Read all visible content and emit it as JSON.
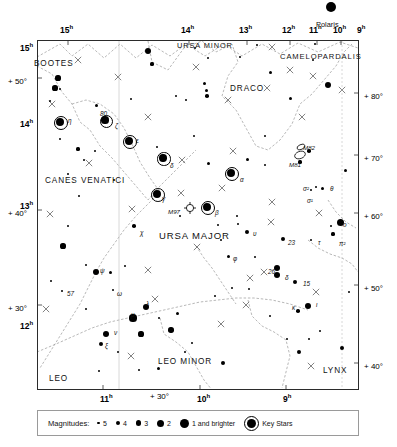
{
  "chart_data": {
    "type": "scatter",
    "projection": "equatorial",
    "xlabel": "Right Ascension (hours)",
    "ylabel": "Declination (degrees)",
    "xlim": [
      15.5,
      8.5
    ],
    "ylim": [
      35,
      85
    ],
    "grid": true,
    "legend_position": "bottom",
    "ra_ticks_top": [
      "15",
      "14",
      "13",
      "12",
      "11",
      "10",
      "9"
    ],
    "ra_ticks_bottom": [
      "11",
      "10",
      "9"
    ],
    "dec_ticks_left": [
      "+50",
      "+40",
      "+30"
    ],
    "dec_ticks_right": [
      "+80",
      "+70",
      "+60",
      "+50",
      "+40"
    ],
    "left_ra_ticks": [
      "15",
      "14",
      "13",
      "12"
    ],
    "constellations": [
      "URSA MAJOR",
      "URSA MINOR",
      "DRACO",
      "CAMELOPARDALIS",
      "BOOTES",
      "CANES VENATICI",
      "LEO",
      "LEO MINOR",
      "LYNX"
    ],
    "named_stars": [
      "Polaris",
      "η",
      "ζ",
      "ε",
      "δ",
      "γ",
      "β",
      "α",
      "χ",
      "ψ",
      "ν",
      "ξ",
      "λ",
      "μ",
      "κ",
      "ι",
      "υ",
      "φ",
      "θ",
      "τ",
      "ο",
      "ω",
      "σ¹",
      "σ²",
      "π²",
      "80",
      "57",
      "26",
      "15",
      "23"
    ],
    "deep_sky": [
      "M81",
      "M82",
      "M97"
    ]
  },
  "frame": {
    "hour_labels_top": [
      {
        "text": "15",
        "sup": "h",
        "x": 60,
        "y": 24
      },
      {
        "text": "14",
        "sup": "h",
        "x": 181,
        "y": 24
      },
      {
        "text": "13",
        "sup": "h",
        "x": 239,
        "y": 24
      },
      {
        "text": "12",
        "sup": "h",
        "x": 282,
        "y": 24
      },
      {
        "text": "11",
        "sup": "h",
        "x": 309,
        "y": 24
      },
      {
        "text": "10",
        "sup": "h",
        "x": 333,
        "y": 24
      },
      {
        "text": "9",
        "sup": "h",
        "x": 357,
        "y": 24
      }
    ],
    "hour_labels_bottom": [
      {
        "text": "11",
        "sup": "h",
        "x": 100,
        "y": 393
      },
      {
        "text": "10",
        "sup": "h",
        "x": 197,
        "y": 393
      },
      {
        "text": "9",
        "sup": "h",
        "x": 283,
        "y": 393
      }
    ],
    "hour_labels_left": [
      {
        "text": "15",
        "sup": "h",
        "x": 20,
        "y": 42
      },
      {
        "text": "14",
        "sup": "h",
        "x": 20,
        "y": 118
      },
      {
        "text": "13",
        "sup": "h",
        "x": 20,
        "y": 200
      },
      {
        "text": "12",
        "sup": "h",
        "x": 20,
        "y": 320
      }
    ],
    "dec_labels_left": [
      {
        "text": "+ 50°",
        "x": 8,
        "y": 78
      },
      {
        "text": "+ 40°",
        "x": 8,
        "y": 210
      },
      {
        "text": "+ 30°",
        "x": 8,
        "y": 305
      }
    ],
    "dec_labels_right": [
      {
        "text": "+ 80°",
        "x": 364,
        "y": 93
      },
      {
        "text": "+ 70°",
        "x": 364,
        "y": 155
      },
      {
        "text": "+ 60°",
        "x": 364,
        "y": 213
      },
      {
        "text": "+ 50°",
        "x": 364,
        "y": 285
      },
      {
        "text": "+ 40°",
        "x": 364,
        "y": 363
      }
    ],
    "bottom_dec_label": {
      "text": "+ 30°",
      "x": 150,
      "y": 393
    }
  },
  "constellation_labels": [
    {
      "name": "BOOTES",
      "x": 34,
      "y": 60,
      "size": 8.2
    },
    {
      "name": "CANES VENATICI",
      "x": 45,
      "y": 177,
      "size": 8.2
    },
    {
      "name": "URSA MAJOR",
      "x": 159,
      "y": 231,
      "size": 9.5
    },
    {
      "name": "URSA MINOR",
      "x": 177,
      "y": 42,
      "size": 7.4
    },
    {
      "name": "DRACO",
      "x": 230,
      "y": 85,
      "size": 8.2
    },
    {
      "name": "CAMELOPARDALIS",
      "x": 280,
      "y": 53,
      "size": 7.6
    },
    {
      "name": "LEO",
      "x": 49,
      "y": 375,
      "size": 8.2
    },
    {
      "name": "LEO MINOR",
      "x": 158,
      "y": 358,
      "size": 8.2
    },
    {
      "name": "LYNX",
      "x": 323,
      "y": 367,
      "size": 8.2
    }
  ],
  "polaris": {
    "label": "Polaris",
    "x": 331,
    "y": 7,
    "label_x": 316,
    "label_y": 21,
    "r": 5.2
  },
  "star_labels": [
    {
      "text": "η",
      "x": 68,
      "y": 118
    },
    {
      "text": "80",
      "x": 100,
      "y": 111
    },
    {
      "text": "ζ",
      "x": 115,
      "y": 123
    },
    {
      "text": "ε",
      "x": 136,
      "y": 138
    },
    {
      "text": "δ",
      "x": 170,
      "y": 163
    },
    {
      "text": "γ",
      "x": 162,
      "y": 196
    },
    {
      "text": "M97",
      "x": 168,
      "y": 209
    },
    {
      "text": "β",
      "x": 215,
      "y": 210
    },
    {
      "text": "α",
      "x": 240,
      "y": 177
    },
    {
      "text": "χ",
      "x": 140,
      "y": 230
    },
    {
      "text": "ψ",
      "x": 100,
      "y": 268
    },
    {
      "text": "57",
      "x": 67,
      "y": 291
    },
    {
      "text": "ω",
      "x": 117,
      "y": 291
    },
    {
      "text": "ν",
      "x": 114,
      "y": 330
    },
    {
      "text": "ξ",
      "x": 105,
      "y": 343
    },
    {
      "text": "λ",
      "x": 146,
      "y": 301
    },
    {
      "text": "μ",
      "x": 131,
      "y": 312
    },
    {
      "text": "κ",
      "x": 292,
      "y": 305
    },
    {
      "text": "ι",
      "x": 316,
      "y": 302
    },
    {
      "text": "26",
      "x": 268,
      "y": 269
    },
    {
      "text": "δ",
      "x": 285,
      "y": 275
    },
    {
      "text": "15",
      "x": 303,
      "y": 281
    },
    {
      "text": "φ",
      "x": 233,
      "y": 256
    },
    {
      "text": "υ",
      "x": 253,
      "y": 231
    },
    {
      "text": "23",
      "x": 288,
      "y": 240
    },
    {
      "text": "τ",
      "x": 318,
      "y": 240
    },
    {
      "text": "σ²",
      "x": 303,
      "y": 186
    },
    {
      "text": "σ¹",
      "x": 307,
      "y": 198
    },
    {
      "text": "θ",
      "x": 330,
      "y": 186
    },
    {
      "text": "π²",
      "x": 339,
      "y": 241
    },
    {
      "text": "ο",
      "x": 343,
      "y": 222
    },
    {
      "text": "M81",
      "x": 289,
      "y": 162
    },
    {
      "text": "M82",
      "x": 303,
      "y": 145
    }
  ],
  "legend": {
    "title": "Magnitudes:",
    "items": [
      {
        "label": "5",
        "r": 1.3
      },
      {
        "label": "4",
        "r": 2.0
      },
      {
        "label": "3",
        "r": 2.7
      },
      {
        "label": "2",
        "r": 3.5
      },
      {
        "label": "1 and brighter",
        "r": 4.5
      }
    ],
    "key_stars_label": "Key Stars"
  },
  "stars": [
    {
      "x": 148,
      "y": 51,
      "r": 3.0,
      "key": false
    },
    {
      "x": 195,
      "y": 48,
      "r": 1.3,
      "key": false
    },
    {
      "x": 152,
      "y": 64,
      "r": 1.6,
      "key": false
    },
    {
      "x": 240,
      "y": 57,
      "r": 1.3,
      "key": false
    },
    {
      "x": 257,
      "y": 45,
      "r": 1.4,
      "key": false
    },
    {
      "x": 270,
      "y": 72,
      "r": 1.5,
      "key": false
    },
    {
      "x": 315,
      "y": 44,
      "r": 1.3,
      "key": false
    },
    {
      "x": 313,
      "y": 60,
      "r": 1.4,
      "key": false
    },
    {
      "x": 328,
      "y": 85,
      "r": 3.2,
      "key": false
    },
    {
      "x": 206,
      "y": 90,
      "r": 1.5,
      "key": false
    },
    {
      "x": 207,
      "y": 96,
      "r": 1.8,
      "key": false
    },
    {
      "x": 204,
      "y": 83,
      "r": 1.5,
      "key": false
    },
    {
      "x": 176,
      "y": 96,
      "r": 1.3,
      "key": false
    },
    {
      "x": 186,
      "y": 100,
      "r": 1.3,
      "key": false
    },
    {
      "x": 131,
      "y": 99,
      "r": 1.4,
      "key": false
    },
    {
      "x": 290,
      "y": 98,
      "r": 1.5,
      "key": false
    },
    {
      "x": 58,
      "y": 78,
      "r": 2.6,
      "key": false
    },
    {
      "x": 55,
      "y": 88,
      "r": 2.6,
      "key": false
    },
    {
      "x": 60,
      "y": 89,
      "r": 1.4,
      "key": false
    },
    {
      "x": 50,
      "y": 101,
      "r": 1.4,
      "key": false
    },
    {
      "x": 96,
      "y": 105,
      "r": 1.5,
      "key": false
    },
    {
      "x": 60,
      "y": 122,
      "r": 4.1,
      "key": true
    },
    {
      "x": 105,
      "y": 120,
      "r": 3.6,
      "key": true
    },
    {
      "x": 129,
      "y": 141,
      "r": 4.2,
      "key": true
    },
    {
      "x": 163,
      "y": 158,
      "r": 3.7,
      "key": true
    },
    {
      "x": 157,
      "y": 194,
      "r": 4.0,
      "key": true
    },
    {
      "x": 207,
      "y": 207,
      "r": 4.2,
      "key": true
    },
    {
      "x": 231,
      "y": 173,
      "r": 4.3,
      "key": true
    },
    {
      "x": 60,
      "y": 139,
      "r": 1.4,
      "key": false
    },
    {
      "x": 78,
      "y": 149,
      "r": 1.6,
      "key": false
    },
    {
      "x": 157,
      "y": 147,
      "r": 1.4,
      "key": false
    },
    {
      "x": 194,
      "y": 136,
      "r": 1.4,
      "key": false
    },
    {
      "x": 208,
      "y": 163,
      "r": 1.5,
      "key": false
    },
    {
      "x": 265,
      "y": 136,
      "r": 1.4,
      "key": false
    },
    {
      "x": 247,
      "y": 159,
      "r": 1.5,
      "key": false
    },
    {
      "x": 265,
      "y": 165,
      "r": 1.4,
      "key": false
    },
    {
      "x": 300,
      "y": 162,
      "r": 1.6,
      "key": false
    },
    {
      "x": 309,
      "y": 151,
      "r": 1.8,
      "key": false
    },
    {
      "x": 322,
      "y": 188,
      "r": 1.5,
      "key": false
    },
    {
      "x": 316,
      "y": 187,
      "r": 1.4,
      "key": false
    },
    {
      "x": 311,
      "y": 190,
      "r": 1.3,
      "key": false
    },
    {
      "x": 345,
      "y": 170,
      "r": 1.5,
      "key": false
    },
    {
      "x": 333,
      "y": 234,
      "r": 1.6,
      "key": false
    },
    {
      "x": 331,
      "y": 226,
      "r": 1.3,
      "key": false
    },
    {
      "x": 340,
      "y": 222,
      "r": 3.5,
      "key": false
    },
    {
      "x": 311,
      "y": 240,
      "r": 1.4,
      "key": false
    },
    {
      "x": 283,
      "y": 239,
      "r": 2.1,
      "key": false
    },
    {
      "x": 247,
      "y": 232,
      "r": 2.0,
      "key": false
    },
    {
      "x": 228,
      "y": 256,
      "r": 1.5,
      "key": false
    },
    {
      "x": 79,
      "y": 196,
      "r": 1.4,
      "key": false
    },
    {
      "x": 114,
      "y": 180,
      "r": 1.4,
      "key": false
    },
    {
      "x": 68,
      "y": 174,
      "r": 1.3,
      "key": false
    },
    {
      "x": 95,
      "y": 151,
      "r": 1.4,
      "key": false
    },
    {
      "x": 134,
      "y": 226,
      "r": 1.8,
      "key": false
    },
    {
      "x": 180,
      "y": 216,
      "r": 1.4,
      "key": false
    },
    {
      "x": 218,
      "y": 225,
      "r": 1.4,
      "key": false
    },
    {
      "x": 221,
      "y": 240,
      "r": 1.4,
      "key": false
    },
    {
      "x": 237,
      "y": 216,
      "r": 1.3,
      "key": false
    },
    {
      "x": 238,
      "y": 224,
      "r": 1.3,
      "key": false
    },
    {
      "x": 68,
      "y": 226,
      "r": 1.4,
      "key": false
    },
    {
      "x": 63,
      "y": 246,
      "r": 2.6,
      "key": false
    },
    {
      "x": 51,
      "y": 281,
      "r": 1.3,
      "key": false
    },
    {
      "x": 86,
      "y": 265,
      "r": 1.4,
      "key": false
    },
    {
      "x": 96,
      "y": 272,
      "r": 3.1,
      "key": false
    },
    {
      "x": 110,
      "y": 272,
      "r": 1.5,
      "key": false
    },
    {
      "x": 125,
      "y": 266,
      "r": 1.4,
      "key": false
    },
    {
      "x": 62,
      "y": 291,
      "r": 1.4,
      "key": false
    },
    {
      "x": 113,
      "y": 290,
      "r": 1.3,
      "key": false
    },
    {
      "x": 86,
      "y": 309,
      "r": 1.4,
      "key": false
    },
    {
      "x": 146,
      "y": 307,
      "r": 3.3,
      "key": false
    },
    {
      "x": 133,
      "y": 318,
      "r": 3.6,
      "key": false
    },
    {
      "x": 106,
      "y": 334,
      "r": 3.3,
      "key": false
    },
    {
      "x": 101,
      "y": 344,
      "r": 2.1,
      "key": false
    },
    {
      "x": 141,
      "y": 334,
      "r": 2.6,
      "key": false
    },
    {
      "x": 171,
      "y": 330,
      "r": 2.7,
      "key": false
    },
    {
      "x": 159,
      "y": 318,
      "r": 1.4,
      "key": false
    },
    {
      "x": 177,
      "y": 313,
      "r": 1.5,
      "key": false
    },
    {
      "x": 118,
      "y": 352,
      "r": 1.4,
      "key": false
    },
    {
      "x": 139,
      "y": 370,
      "r": 1.4,
      "key": false
    },
    {
      "x": 158,
      "y": 368,
      "r": 1.5,
      "key": false
    },
    {
      "x": 185,
      "y": 352,
      "r": 1.4,
      "key": false
    },
    {
      "x": 192,
      "y": 343,
      "r": 1.3,
      "key": false
    },
    {
      "x": 223,
      "y": 363,
      "r": 2.1,
      "key": false
    },
    {
      "x": 277,
      "y": 268,
      "r": 3.0,
      "key": false
    },
    {
      "x": 277,
      "y": 275,
      "r": 3.2,
      "key": false
    },
    {
      "x": 295,
      "y": 282,
      "r": 2.4,
      "key": false
    },
    {
      "x": 308,
      "y": 306,
      "r": 3.4,
      "key": false
    },
    {
      "x": 298,
      "y": 311,
      "r": 1.8,
      "key": false
    },
    {
      "x": 255,
      "y": 257,
      "r": 1.3,
      "key": false
    },
    {
      "x": 249,
      "y": 289,
      "r": 1.4,
      "key": false
    },
    {
      "x": 270,
      "y": 316,
      "r": 1.4,
      "key": false
    },
    {
      "x": 320,
      "y": 331,
      "r": 1.4,
      "key": false
    },
    {
      "x": 309,
      "y": 339,
      "r": 1.4,
      "key": false
    },
    {
      "x": 287,
      "y": 339,
      "r": 1.4,
      "key": false
    },
    {
      "x": 299,
      "y": 352,
      "r": 2.3,
      "key": false
    },
    {
      "x": 342,
      "y": 348,
      "r": 2.2,
      "key": false
    },
    {
      "x": 349,
      "y": 292,
      "r": 1.3,
      "key": false
    },
    {
      "x": 232,
      "y": 288,
      "r": 1.3,
      "key": false
    },
    {
      "x": 215,
      "y": 296,
      "r": 1.4,
      "key": false
    },
    {
      "x": 208,
      "y": 58,
      "r": 1.3,
      "key": false
    },
    {
      "x": 99,
      "y": 371,
      "r": 1.3,
      "key": false
    },
    {
      "x": 84,
      "y": 160,
      "r": 1.2,
      "key": false
    }
  ],
  "crosses": [
    {
      "x": 78,
      "y": 60
    },
    {
      "x": 118,
      "y": 77
    },
    {
      "x": 52,
      "y": 104
    },
    {
      "x": 148,
      "y": 117
    },
    {
      "x": 89,
      "y": 163
    },
    {
      "x": 182,
      "y": 160
    },
    {
      "x": 132,
      "y": 209
    },
    {
      "x": 196,
      "y": 67
    },
    {
      "x": 228,
      "y": 100
    },
    {
      "x": 267,
      "y": 88
    },
    {
      "x": 272,
      "y": 47
    },
    {
      "x": 290,
      "y": 70
    },
    {
      "x": 313,
      "y": 76
    },
    {
      "x": 342,
      "y": 90
    },
    {
      "x": 302,
      "y": 117
    },
    {
      "x": 222,
      "y": 188
    },
    {
      "x": 197,
      "y": 247
    },
    {
      "x": 181,
      "y": 193
    },
    {
      "x": 148,
      "y": 270
    },
    {
      "x": 272,
      "y": 202
    },
    {
      "x": 271,
      "y": 222
    },
    {
      "x": 319,
      "y": 213
    },
    {
      "x": 250,
      "y": 278
    },
    {
      "x": 246,
      "y": 305
    },
    {
      "x": 316,
      "y": 292
    },
    {
      "x": 311,
      "y": 366
    },
    {
      "x": 221,
      "y": 324
    },
    {
      "x": 131,
      "y": 356
    },
    {
      "x": 50,
      "y": 214
    },
    {
      "x": 46,
      "y": 309
    },
    {
      "x": 155,
      "y": 299
    },
    {
      "x": 264,
      "y": 272
    },
    {
      "x": 233,
      "y": 151
    }
  ],
  "boundaries": [
    "M 37 57 L 60 44 L 72 56 L 88 44 L 104 58 L 120 44 L 136 58 L 152 45 L 170 56 L 186 44 L 205 56 L 224 44 L 242 56 L 262 44 L 280 54 L 298 43 L 318 52 L 340 42 L 358 48",
    "M 148 41 L 152 62 L 168 70 L 184 48 L 202 41 L 216 52 L 232 44 L 238 62 L 228 76 L 222 96 L 236 110 L 246 128 L 256 146 L 268 150 L 280 140 L 292 124 L 300 104 L 312 94 L 324 80 L 336 66 L 344 52 L 352 44",
    "M 37 66 L 52 74 L 62 92 L 72 104 L 80 122 L 90 130 L 100 146 L 112 158 L 124 172 L 136 186 L 148 200 L 160 186 L 172 174 L 184 162 L 196 150",
    "M 72 104 L 86 100 L 100 104 L 114 114 L 124 128 L 132 144 L 140 162 L 150 178 L 160 192 L 148 204 L 136 216 L 124 230 L 114 244 L 104 258 L 96 272 L 88 288 L 80 304 L 70 320 L 60 336 L 50 352 L 40 368",
    "M 37 352 L 56 344 L 74 336 L 92 328 L 110 322 L 128 318 L 146 314 L 164 310 L 182 306 L 200 302 L 218 300 L 236 298 L 254 298 L 272 300 L 290 304 L 308 310",
    "M 160 318 L 164 334 L 176 342 L 188 352 L 196 366 L 204 380 L 212 390",
    "M 248 300 L 252 316 L 262 326 L 274 332 L 286 340 L 290 356 L 286 372 L 282 388",
    "M 308 240 L 318 248 L 330 254 L 342 258 L 352 264 L 358 272",
    "M 328 200 L 336 212 L 346 222 L 356 228",
    "M 196 246 L 204 258 L 212 268 L 220 280 L 228 292 L 236 304"
  ]
}
